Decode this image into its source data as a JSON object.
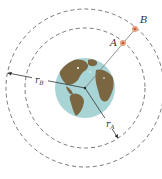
{
  "diagram": {
    "type": "orbital-diagram",
    "labels": {
      "satellite_a": "A",
      "satellite_b": "B",
      "radius_a": "r",
      "radius_a_sub": "A",
      "radius_b": "r",
      "radius_b_sub": "B"
    },
    "colors": {
      "ocean": "#a9d4d6",
      "land": "#7a6640",
      "orbit": "#555555",
      "satellite": "#e8a080",
      "line": "#333333"
    }
  }
}
